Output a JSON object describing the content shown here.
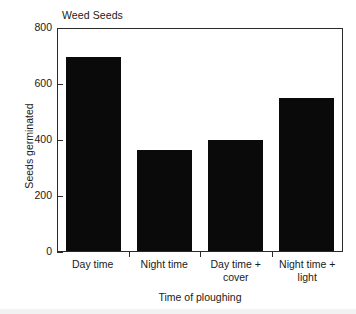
{
  "chart_data": {
    "type": "bar",
    "title": "Weed Seeds",
    "xlabel": "Time of ploughing",
    "ylabel": "Seeds germinated",
    "categories": [
      "Day time",
      "Night time",
      "Day time +\ncover",
      "Night time +\nlight"
    ],
    "category_lines": [
      [
        "Day time"
      ],
      [
        "Night time"
      ],
      [
        "Day time +",
        "cover"
      ],
      [
        "Night time +",
        "light"
      ]
    ],
    "values": [
      700,
      365,
      400,
      550
    ],
    "ylim": [
      0,
      800
    ],
    "yticks": [
      0,
      200,
      400,
      600,
      800
    ],
    "ytick_labels": [
      "0",
      "200",
      "400",
      "600",
      "800"
    ],
    "grid": false,
    "legend": false,
    "bar_color": "#0a0a0a",
    "axis_color": "#2a2a2a",
    "background": "#ffffff"
  }
}
